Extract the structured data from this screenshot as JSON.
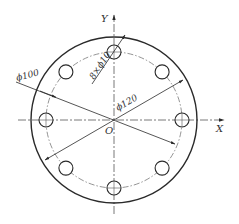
{
  "diagram": {
    "type": "flange bolt-hole pattern drawing",
    "colors": {
      "line": "#2a2a2a",
      "centerline": "#555555",
      "text": "#333333",
      "background": "#ffffff"
    },
    "axes": {
      "x_label": "X",
      "y_label": "Y",
      "origin_label": "O"
    },
    "dimensions": {
      "outer_diameter": "ϕ120",
      "pitch_circle_diameter": "ϕ100",
      "holes": "8×ϕ10"
    },
    "geometry": {
      "center": [
        114,
        120
      ],
      "outer_radius": 83,
      "pitch_radius": 68,
      "hole_radius": 7,
      "hole_count": 8
    }
  }
}
